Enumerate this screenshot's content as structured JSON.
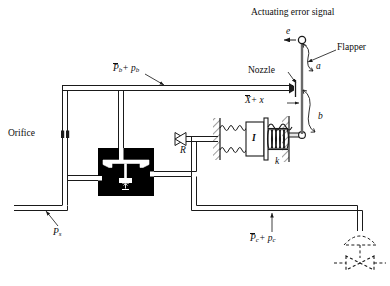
{
  "figure": {
    "caption": ""
  },
  "labels": {
    "actuating_error_signal": "Actuating error signal",
    "error_symbol": "e",
    "flapper": "Flapper",
    "dim_a": "a",
    "dim_b": "b",
    "nozzle": "Nozzle",
    "displacement_bar": "X",
    "displacement_rest": "+ x",
    "pressure_b_bar": "P",
    "pressure_b_sub": "b",
    "pressure_b_rest": "+ p",
    "pressure_b_rest_sub": "b",
    "orifice": "Orifice",
    "supply_pressure": "P",
    "supply_pressure_sub": "s",
    "restriction_R": "R",
    "inertia_I": "I",
    "spring_k": "k",
    "pressure_c_bar": "P",
    "pressure_c_sub": "c",
    "pressure_c_rest": "+ p",
    "pressure_c_rest_sub": "c"
  },
  "colors": {
    "line": "#1a1a1a",
    "pipe_fill": "#ffffff",
    "valve_body": "#000000",
    "background": "#ffffff",
    "leader": "#333333"
  },
  "components": [
    {
      "name": "flapper-pivot",
      "type": "pivot-circle",
      "x": 302,
      "y": 41
    },
    {
      "name": "flapper-rod",
      "type": "rod",
      "x": 302,
      "y_top": 41,
      "y_bottom": 137
    },
    {
      "name": "nozzle",
      "type": "nozzle",
      "x": 294,
      "y": 88
    },
    {
      "name": "orifice",
      "type": "restriction",
      "x": 68,
      "y": 134
    },
    {
      "name": "relay-valve-body",
      "type": "black-block",
      "x": 98,
      "y": 148,
      "w": 56,
      "h": 48
    },
    {
      "name": "restriction-valve-R",
      "type": "bowtie-valve",
      "x": 186,
      "y": 136
    },
    {
      "name": "dashpot-I",
      "type": "piston-cylinder",
      "x": 244,
      "y": 136
    },
    {
      "name": "spring-k",
      "type": "coil-spring",
      "x": 272,
      "y": 136
    },
    {
      "name": "bellows-left",
      "type": "coil",
      "x": 212,
      "y": 128
    },
    {
      "name": "control-valve",
      "type": "dashed-bowtie",
      "x": 358,
      "y": 262
    },
    {
      "name": "valve-actuator",
      "type": "dashed-dome",
      "x": 358,
      "y": 232
    }
  ]
}
